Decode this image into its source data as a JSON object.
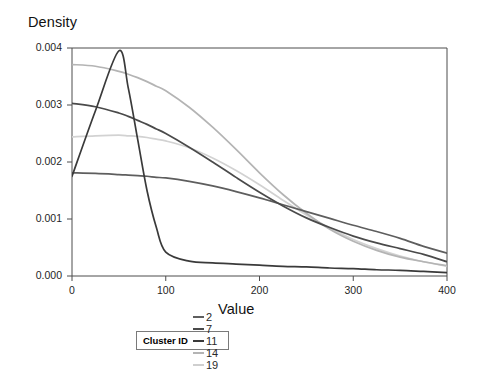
{
  "chart_data": {
    "type": "line",
    "title": "",
    "xlabel": "Value",
    "ylabel": "Density",
    "xlim": [
      0,
      400
    ],
    "ylim": [
      0,
      0.004
    ],
    "xticks": [
      "0",
      "100",
      "200",
      "300",
      "400"
    ],
    "xtick_values": [
      0,
      100,
      200,
      300,
      400
    ],
    "yticks": [
      "0.000",
      "0.001",
      "0.002",
      "0.003",
      "0.004"
    ],
    "ytick_values": [
      0,
      0.001,
      0.002,
      0.003,
      0.004
    ],
    "grid": false,
    "legend_position": "bottom",
    "legend_title": "Cluster ID",
    "x": [
      0,
      25,
      50,
      60,
      70,
      80,
      90,
      100,
      125,
      150,
      175,
      200,
      225,
      250,
      275,
      300,
      325,
      350,
      375,
      400
    ],
    "series": [
      {
        "name": "2",
        "color": "#5e5e5e",
        "values": [
          0.00181,
          0.0018,
          0.00178,
          0.00177,
          0.00176,
          0.00175,
          0.00173,
          0.00172,
          0.00166,
          0.00158,
          0.00148,
          0.00137,
          0.00125,
          0.00113,
          0.00101,
          0.00089,
          0.00078,
          0.00066,
          0.00052,
          0.0004
        ]
      },
      {
        "name": "7",
        "color": "#4a4a4a",
        "values": [
          0.00303,
          0.00297,
          0.00286,
          0.0028,
          0.00273,
          0.00266,
          0.00258,
          0.0025,
          0.00226,
          0.002,
          0.00173,
          0.00147,
          0.00123,
          0.00102,
          0.00085,
          0.0007,
          0.00058,
          0.00048,
          0.00038,
          0.00025
        ]
      },
      {
        "name": "11",
        "color": "#3a3a3a",
        "values": [
          0.00175,
          0.0029,
          0.00395,
          0.0033,
          0.0024,
          0.0015,
          0.00085,
          0.00042,
          0.00026,
          0.00023,
          0.00021,
          0.00019,
          0.00017,
          0.00016,
          0.00014,
          0.00013,
          0.00011,
          0.0001,
          8e-05,
          6e-05
        ]
      },
      {
        "name": "14",
        "color": "#b4b4b4",
        "values": [
          0.00371,
          0.00368,
          0.00359,
          0.00354,
          0.00348,
          0.00341,
          0.00333,
          0.00325,
          0.00296,
          0.00261,
          0.00222,
          0.00181,
          0.00143,
          0.0011,
          0.00082,
          0.00061,
          0.00045,
          0.00033,
          0.00025,
          0.00018
        ]
      },
      {
        "name": "19",
        "color": "#d2d2d2",
        "values": [
          0.00244,
          0.00246,
          0.00247,
          0.00246,
          0.00245,
          0.00243,
          0.0024,
          0.00237,
          0.00225,
          0.00207,
          0.00185,
          0.0016,
          0.00133,
          0.00107,
          0.00084,
          0.00064,
          0.00048,
          0.00035,
          0.00025,
          0.00017
        ]
      }
    ]
  },
  "legend": {
    "title": "Cluster ID",
    "entries": [
      {
        "label": "2",
        "color": "#5e5e5e"
      },
      {
        "label": "7",
        "color": "#4a4a4a"
      },
      {
        "label": "11",
        "color": "#3a3a3a"
      },
      {
        "label": "14",
        "color": "#b4b4b4"
      },
      {
        "label": "19",
        "color": "#cfcfcf"
      }
    ]
  },
  "style": {
    "axis_color": "#4d4d4d",
    "text_color": "#1a1a1a",
    "background": "#ffffff"
  }
}
